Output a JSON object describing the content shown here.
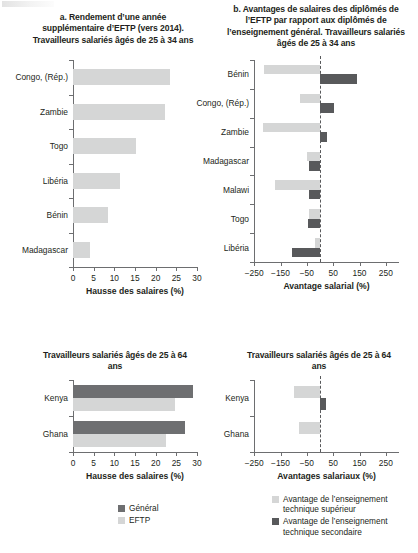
{
  "figure": {
    "panels": [
      {
        "id": "a",
        "title": "a. Rendement d’une année supplémentaire d’EFTP (vers 2014). Travailleurs salariés âgés de 25 à 34 ans"
      },
      {
        "id": "b",
        "title": "b. Avantages de salaires des diplômés de l’EFTP par rapport aux diplômés de l’enseignement général. Travailleurs salariés âgés de 25 à 34 ans"
      },
      {
        "id": "c",
        "title": "Travailleurs salariés âgés de 25 à 64 ans"
      },
      {
        "id": "d",
        "title": "Travailleurs salariés âgés de 25 à 64 ans"
      }
    ]
  },
  "legends": {
    "left": {
      "name": "legend-left",
      "items": [
        {
          "label": "Général",
          "color": "#6e6f71"
        },
        {
          "label": "EFTP",
          "color": "#d5d6d6"
        }
      ]
    },
    "right": {
      "name": "legend-right",
      "items": [
        {
          "label": "Avantage de l’enseignement technique supérieur",
          "color": "#d5d6d6"
        },
        {
          "label": "Avantage de l’enseignement technique secondaire",
          "color": "#58595b"
        }
      ]
    }
  },
  "chart_data": [
    {
      "id": "a",
      "type": "bar",
      "orientation": "horizontal",
      "title": "a. Rendement d’une année supplémentaire d’EFTP (vers 2014). Travailleurs salariés âgés de 25 à 34 ans",
      "xlabel": "Hausse des salaires (%)",
      "ylabel": "",
      "xlim": [
        0,
        30
      ],
      "xticks": [
        0,
        5,
        10,
        15,
        20,
        25,
        30
      ],
      "xticklabels": [
        "0",
        "5",
        "10",
        "15",
        "20",
        "25",
        "30"
      ],
      "grid": false,
      "legend": "none",
      "categories": [
        "Congo, (Rép.)",
        "Zambie",
        "Togo",
        "Libéria",
        "Bénin",
        "Madagascar"
      ],
      "series": [
        {
          "name": "EFTP",
          "color": "#d5d6d6",
          "values": [
            23.4,
            22.3,
            15.3,
            11.4,
            8.5,
            4.0
          ]
        }
      ]
    },
    {
      "id": "b",
      "type": "bar",
      "orientation": "horizontal",
      "title": "b. Avantages de salaires des diplômés de l’EFTP par rapport aux diplômés de l’enseignement général. Travailleurs salariés âgés de 25 à 34 ans",
      "xlabel": "Avantage salarial (%)",
      "ylabel": "",
      "xlim": [
        -300,
        300
      ],
      "xticks": [
        -250,
        -150,
        -50,
        50,
        150,
        250
      ],
      "xticklabels": [
        "−250",
        "−150",
        "−50",
        "50",
        "150",
        "250"
      ],
      "grid": false,
      "zeroline": 0,
      "legend": "bottom-right",
      "categories": [
        "Bénin",
        "Congo, (Rép.)",
        "Zambie",
        "Madagascar",
        "Malawi",
        "Togo",
        "Libéria"
      ],
      "series": [
        {
          "name": "Avantage de l’enseignement technique supérieur",
          "color": "#d5d6d6",
          "values": [
            -212,
            -75,
            -215,
            -48,
            -172,
            -42,
            -18
          ]
        },
        {
          "name": "Avantage de l’enseignement technique secondaire",
          "color": "#58595b",
          "values": [
            140,
            52,
            25,
            -40,
            -42,
            -44,
            -108
          ]
        }
      ]
    },
    {
      "id": "c",
      "type": "bar",
      "orientation": "horizontal",
      "title": "Travailleurs salariés âgés de 25 à 64 ans",
      "xlabel": "Hausse des salaires (%)",
      "ylabel": "",
      "xlim": [
        0,
        30
      ],
      "xticks": [
        0,
        5,
        10,
        15,
        20,
        25,
        30
      ],
      "xticklabels": [
        "0",
        "5",
        "10",
        "15",
        "20",
        "25",
        "30"
      ],
      "grid": false,
      "legend": "bottom",
      "categories": [
        "Kenya",
        "Ghana"
      ],
      "series": [
        {
          "name": "Général",
          "color": "#6e6f71",
          "values": [
            29.0,
            27.0
          ]
        },
        {
          "name": "EFTP",
          "color": "#d5d6d6",
          "values": [
            24.7,
            22.6
          ]
        }
      ]
    },
    {
      "id": "d",
      "type": "bar",
      "orientation": "horizontal",
      "title": "Travailleurs salariés âgés de 25 à 64 ans",
      "xlabel": "Avantages salariaux (%)",
      "ylabel": "",
      "xlim": [
        -300,
        300
      ],
      "xticks": [
        -250,
        -150,
        -50,
        50,
        150,
        250
      ],
      "xticklabels": [
        "−250",
        "−150",
        "−50",
        "50",
        "150",
        "250"
      ],
      "grid": false,
      "zeroline": 0,
      "legend": "bottom",
      "categories": [
        "Kenya",
        "Ghana"
      ],
      "series": [
        {
          "name": "Avantage de l’enseignement technique supérieur",
          "color": "#d5d6d6",
          "values": [
            -100,
            -78
          ]
        },
        {
          "name": "Avantage de l’enseignement technique secondaire",
          "color": "#58595b",
          "values": [
            22,
            0
          ]
        }
      ]
    }
  ]
}
